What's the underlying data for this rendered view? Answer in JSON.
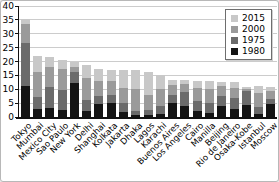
{
  "chart_data": {
    "type": "bar",
    "subtype": "overlaid-grayscale-population-bars",
    "title": "",
    "xlabel": "",
    "ylabel": "",
    "ylim": [
      0,
      40
    ],
    "yticks": [
      0,
      5,
      10,
      15,
      20,
      25,
      30,
      35,
      40
    ],
    "grid": true,
    "legend_position": "top-right",
    "categories": [
      "Tokyo",
      "Mumbai",
      "Mexico City",
      "Sao Paulo",
      "New York",
      "Delhi",
      "Shanghai",
      "Kolkata",
      "Jakarta",
      "Dhaka",
      "Lagos",
      "Karachi",
      "Buenos Aires",
      "Los Angeles",
      "Cairo",
      "Manilla",
      "Beijing",
      "Rio de Janeiro",
      "Osaka-Kobe",
      "Istanbul",
      "Moscow"
    ],
    "series": [
      {
        "name": "2015",
        "color": "#c8c8c8",
        "values": [
          35.5,
          22.0,
          21.5,
          20.7,
          20.0,
          18.7,
          17.4,
          17.1,
          16.8,
          16.8,
          16.1,
          15.2,
          13.4,
          13.2,
          12.9,
          12.9,
          12.5,
          12.5,
          10.9,
          11.0,
          10.7
        ]
      },
      {
        "name": "2000",
        "color": "#9a9a9a",
        "values": [
          33.5,
          16.4,
          18.1,
          17.3,
          18.2,
          14.0,
          13.0,
          13.1,
          10.5,
          10.2,
          8.0,
          10.0,
          11.5,
          11.8,
          10.4,
          10.2,
          11.1,
          10.4,
          10.2,
          8.7,
          9.5
        ]
      },
      {
        "name": "1975",
        "color": "#6b6b6b",
        "values": [
          26.5,
          7.1,
          10.7,
          9.6,
          16.1,
          6.0,
          7.5,
          8.1,
          5.1,
          2.2,
          2.7,
          4.0,
          8.0,
          9.0,
          5.9,
          5.1,
          7.5,
          7.0,
          9.3,
          3.5,
          6.5
        ]
      },
      {
        "name": "1980",
        "color": "#141414",
        "values": [
          11.3,
          2.9,
          3.1,
          2.4,
          12.3,
          2.1,
          4.7,
          4.9,
          1.8,
          0.8,
          0.7,
          1.0,
          5.0,
          4.0,
          2.2,
          1.4,
          3.9,
          2.9,
          4.2,
          1.0,
          4.7
        ]
      }
    ]
  }
}
